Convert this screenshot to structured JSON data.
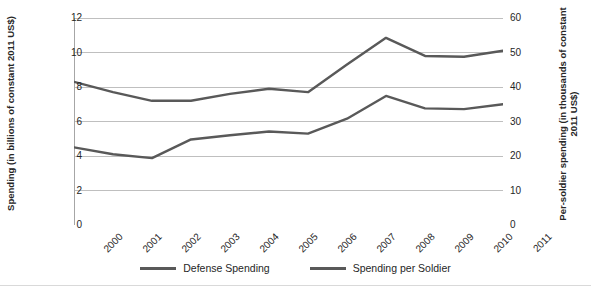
{
  "title": "",
  "axes": {
    "left": {
      "title": "Spending (in billions of constant 2011 US$)",
      "ticks": [
        "0",
        "2",
        "4",
        "6",
        "8",
        "10",
        "12"
      ],
      "min": 0,
      "max": 12
    },
    "right": {
      "title": "Per-soldier spending (in thousands of constant 2011 US$)",
      "ticks": [
        "0",
        "10",
        "20",
        "30",
        "40",
        "50",
        "60"
      ],
      "min": 0,
      "max": 60
    },
    "x": {
      "ticks": [
        "2000",
        "2001",
        "2002",
        "2003",
        "2004",
        "2005",
        "2006",
        "2007",
        "2008",
        "2009",
        "2010",
        "2011"
      ]
    }
  },
  "legend": {
    "items": [
      {
        "label": "Defense Spending",
        "color": "#595959"
      },
      {
        "label": "Spending per Soldier",
        "color": "#595959"
      }
    ]
  },
  "colors": {
    "line": "#595959",
    "grid": "#bfbfbf",
    "axis": "#a6a6a6",
    "text": "#262626"
  },
  "chart_data": {
    "type": "line",
    "title": "",
    "xlabel": "",
    "ylabel": "Spending (in billions of constant 2011 US$)",
    "y2label": "Per-soldier spending (in thousands of constant 2011 US$)",
    "x": [
      "2000",
      "2001",
      "2002",
      "2003",
      "2004",
      "2005",
      "2006",
      "2007",
      "2008",
      "2009",
      "2010",
      "2011"
    ],
    "ylim": [
      0,
      12
    ],
    "y2lim": [
      0,
      60
    ],
    "grid": true,
    "legend_position": "bottom",
    "series": [
      {
        "name": "Defense Spending",
        "axis": "left",
        "units": "billions of constant 2011 US$",
        "color": "#595959",
        "values": [
          8.3,
          7.7,
          7.2,
          7.2,
          7.6,
          7.9,
          7.7,
          9.3,
          10.85,
          9.8,
          9.75,
          10.1
        ]
      },
      {
        "name": "Spending per Soldier",
        "axis": "right",
        "units": "thousands of constant 2011 US$",
        "color": "#595959",
        "values": [
          22.5,
          20.5,
          19.4,
          24.8,
          26.0,
          27.1,
          26.5,
          30.8,
          37.4,
          33.8,
          33.6,
          35.0
        ]
      }
    ]
  }
}
